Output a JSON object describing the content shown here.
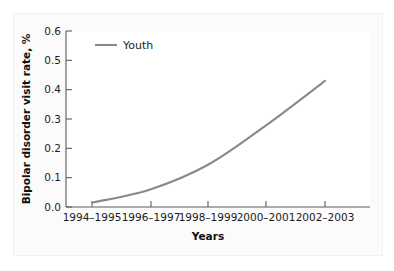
{
  "chart_data": {
    "type": "line",
    "title": "",
    "xlabel": "Years",
    "ylabel": "Bipolar disorder visit rate, %",
    "categories": [
      "1994–1995",
      "1996–1997",
      "1998–1999",
      "2000–2001",
      "2002–2003"
    ],
    "series": [
      {
        "name": "Youth",
        "color": "#8a8a8a",
        "values": [
          0.015,
          0.06,
          0.145,
          0.28,
          0.43
        ]
      }
    ],
    "ylim": [
      0.0,
      0.6
    ],
    "ytick_labels": [
      "0.0",
      "0.1",
      "0.2",
      "0.3",
      "0.4",
      "0.5",
      "0.6"
    ],
    "ytick_values": [
      0.0,
      0.1,
      0.2,
      0.3,
      0.4,
      0.5,
      0.6
    ],
    "grid": false,
    "legend_position": "top-left",
    "legend_entries": [
      "Youth"
    ]
  },
  "axes": {
    "y_title": "Bipolar disorder visit rate, %",
    "x_title": "Years",
    "y_ticks": [
      "0.0",
      "0.1",
      "0.2",
      "0.3",
      "0.4",
      "0.5",
      "0.6"
    ],
    "x_ticks": [
      "1994–1995",
      "1996–1997",
      "1998–1999",
      "2000–2001",
      "2002–2003"
    ]
  },
  "legend": {
    "youth_label": "Youth"
  },
  "colors": {
    "series_line": "#8a8a8a",
    "axis": "#5d5d5d",
    "text": "#1b1b1b",
    "panel_background": "#fbfbfb",
    "figure_background": "#ffffff"
  }
}
